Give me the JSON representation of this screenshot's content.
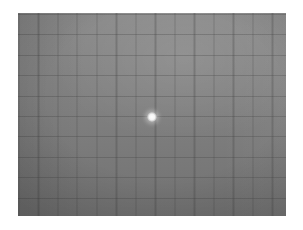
{
  "scene": {
    "description": "Grayscale photo of a square grid surface with a bright point of light at the center",
    "grid": {
      "columns": 13,
      "rows": 10,
      "line_color": "#3c3c3c",
      "background_top": "#8a8a8a",
      "background_bottom": "#727272"
    },
    "spot": {
      "color": "#ffffff"
    }
  }
}
